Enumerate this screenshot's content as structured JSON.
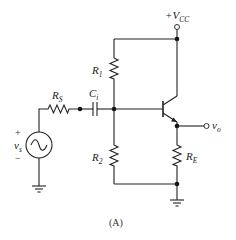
{
  "diagram": {
    "caption": "(A)",
    "labels": {
      "vcc": {
        "prefix": "+V",
        "sub": "CC"
      },
      "r1": {
        "main": "R",
        "sub": "1"
      },
      "r2": {
        "main": "R",
        "sub": "2"
      },
      "rs": {
        "main": "R",
        "sub": "S"
      },
      "ci": {
        "main": "C",
        "sub": "i"
      },
      "re": {
        "main": "R",
        "sub": "E"
      },
      "vs": {
        "main": "v",
        "sub": "s"
      },
      "vo": {
        "main": "v",
        "sub": "o"
      },
      "plus": "+",
      "minus": "−"
    },
    "components": [
      "source-vs",
      "resistor-rs",
      "capacitor-ci",
      "resistor-r1",
      "resistor-r2",
      "npn-transistor",
      "resistor-re",
      "ground",
      "vcc-terminal",
      "output-terminal"
    ]
  }
}
